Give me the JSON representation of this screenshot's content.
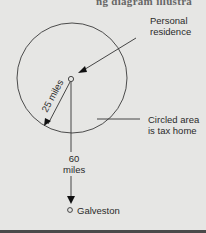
{
  "header": {
    "cropped_text": "ng diagram illustra"
  },
  "diagram": {
    "labels": {
      "personal_residence": [
        "Personal",
        "residence"
      ],
      "radius": "25 miles",
      "circled_area": [
        "Circled area",
        "is tax home"
      ],
      "distance": [
        "60",
        "miles"
      ],
      "destination": "Galveston"
    },
    "colors": {
      "background": "#e6e6e4",
      "line": "#333333",
      "text": "#2a2a2a"
    }
  }
}
